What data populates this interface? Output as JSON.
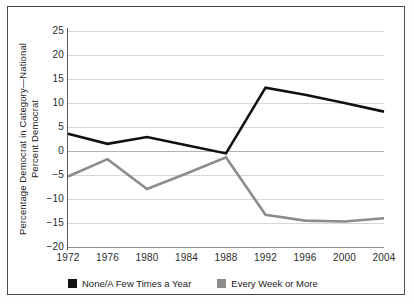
{
  "chart_data": {
    "type": "line",
    "title": "",
    "xlabel": "",
    "ylabel": "Percentage Democrat in Category—National Percent Democrat",
    "ylabel_line1": "Percentage Democrat in Category—National",
    "ylabel_line2": "Percent Democrat",
    "categories": [
      "1972",
      "1976",
      "1980",
      "1984",
      "1988",
      "1992",
      "1996",
      "2000",
      "2004"
    ],
    "x": [
      1972,
      1976,
      1980,
      1984,
      1988,
      1992,
      1996,
      2000,
      2004
    ],
    "ylim": [
      -20,
      25
    ],
    "yticks": [
      "25",
      "20",
      "15",
      "10",
      "5",
      "0",
      "−5",
      "−10",
      "−15",
      "−20"
    ],
    "ytick_values": [
      25,
      20,
      15,
      10,
      5,
      0,
      -5,
      -10,
      -15,
      -20
    ],
    "grid": true,
    "legend_position": "bottom",
    "series": [
      {
        "name": "None/A Few Times a Year",
        "color": "#111111",
        "values": [
          3.6,
          1.5,
          2.9,
          1.2,
          -0.5,
          13.2,
          11.7,
          10.0,
          8.2
        ]
      },
      {
        "name": "Every Week or More",
        "color": "#8c8c8c",
        "values": [
          -5.3,
          -1.7,
          -7.9,
          -4.7,
          -1.3,
          -13.3,
          -14.5,
          -14.7,
          -14.0
        ]
      }
    ]
  },
  "legend": {
    "items": [
      {
        "label": "None/A Few Times a Year",
        "color": "#111111"
      },
      {
        "label": "Every Week or More",
        "color": "#8c8c8c"
      }
    ]
  },
  "colors": {
    "series_black": "#111111",
    "series_gray": "#8c8c8c",
    "grid": "#d8d8d8",
    "axis": "#5a5a5a",
    "frame": "#4b4b4b",
    "background": "#ffffff",
    "text": "#1d1d1d"
  }
}
